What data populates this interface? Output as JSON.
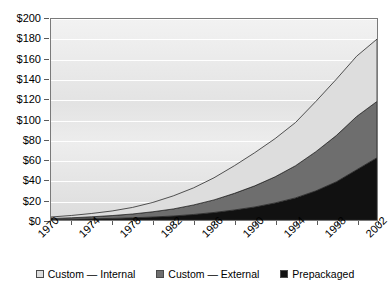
{
  "chart_data": {
    "type": "area",
    "stacked": true,
    "title": "",
    "xlabel": "",
    "ylabel": "",
    "x": [
      1970,
      1972,
      1974,
      1976,
      1978,
      1980,
      1982,
      1984,
      1986,
      1988,
      1990,
      1992,
      1994,
      1996,
      1998,
      2000,
      2002
    ],
    "xlim": [
      1970,
      2002
    ],
    "ylim": [
      0,
      200
    ],
    "grid": true,
    "legend_position": "bottom",
    "x_tick_labels": [
      "1970",
      "1974",
      "1978",
      "1982",
      "1986",
      "1990",
      "1994",
      "1998",
      "2002"
    ],
    "x_tick_values": [
      1970,
      1974,
      1978,
      1982,
      1986,
      1990,
      1994,
      1998,
      2002
    ],
    "y_tick_labels": [
      "$0",
      "$20",
      "$40",
      "$60",
      "$80",
      "$100",
      "$120",
      "$140",
      "$160",
      "$180",
      "$200"
    ],
    "y_tick_values": [
      0,
      20,
      40,
      60,
      80,
      100,
      120,
      140,
      160,
      180,
      200
    ],
    "series": [
      {
        "name": "Prepackaged",
        "color": "#111111",
        "values": [
          0.5,
          0.8,
          1.2,
          1.6,
          2.2,
          3.0,
          4.0,
          5.5,
          7.5,
          10.0,
          13.0,
          17.0,
          22.0,
          29.0,
          38.0,
          50.0,
          62.0
        ]
      },
      {
        "name": "Custom — External",
        "color": "#6e6e6e",
        "values": [
          1.0,
          1.4,
          2.0,
          2.8,
          3.8,
          5.2,
          7.0,
          9.5,
          12.5,
          16.5,
          21.0,
          26.0,
          32.0,
          39.0,
          46.0,
          53.0,
          56.0
        ]
      },
      {
        "name": "Custom — Internal",
        "color": "#dddddd",
        "values": [
          1.5,
          2.3,
          3.3,
          4.6,
          6.5,
          9.3,
          13.0,
          17.0,
          22.0,
          27.5,
          33.0,
          38.0,
          43.0,
          50.0,
          56.0,
          60.0,
          62.0
        ]
      }
    ],
    "stack_totals": [
      3.0,
      4.5,
      6.5,
      9.0,
      12.5,
      17.5,
      24.0,
      32.0,
      42.0,
      54.0,
      67.0,
      81.0,
      97.0,
      118.0,
      140.0,
      163.0,
      180.0
    ]
  },
  "legend": {
    "items": [
      {
        "label": "Custom — Internal",
        "color": "#dddddd"
      },
      {
        "label": "Custom — External",
        "color": "#6e6e6e"
      },
      {
        "label": "Prepackaged",
        "color": "#111111"
      }
    ]
  }
}
